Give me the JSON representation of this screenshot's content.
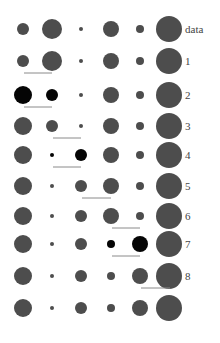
{
  "columns_x": [
    23,
    52,
    81,
    111,
    140,
    169
  ],
  "label_x": 185,
  "colors": {
    "gray": "#4d4d4d",
    "black": "#050505",
    "line": "#8a8a8a"
  },
  "rows": [
    {
      "label": "data",
      "y": 29,
      "radii": [
        6,
        10,
        2,
        8,
        4,
        13
      ],
      "black": [],
      "underline": null
    },
    {
      "label": "1",
      "y": 61,
      "radii": [
        6,
        10,
        2,
        8,
        4,
        13
      ],
      "black": [],
      "underline": [
        24,
        52
      ]
    },
    {
      "label": "2",
      "y": 95,
      "radii": [
        9,
        6,
        2,
        8,
        4,
        13
      ],
      "black": [
        0,
        1
      ],
      "underline": [
        24,
        52
      ]
    },
    {
      "label": "3",
      "y": 126,
      "radii": [
        9,
        6,
        2,
        8,
        4,
        13
      ],
      "black": [],
      "underline": [
        53,
        81
      ]
    },
    {
      "label": "4",
      "y": 155,
      "radii": [
        9,
        2,
        6,
        8,
        4,
        13
      ],
      "black": [
        1,
        2
      ],
      "underline": [
        53,
        81
      ]
    },
    {
      "label": "5",
      "y": 186,
      "radii": [
        9,
        2,
        6,
        8,
        4,
        13
      ],
      "black": [],
      "underline": [
        82,
        111
      ]
    },
    {
      "label": "6",
      "y": 216,
      "radii": [
        9,
        2,
        6,
        8,
        4,
        13
      ],
      "black": [],
      "underline": [
        112,
        140
      ]
    },
    {
      "label": "7",
      "y": 244,
      "radii": [
        9,
        2,
        6,
        4,
        8,
        13
      ],
      "black": [
        3,
        4
      ],
      "underline": [
        112,
        140
      ]
    },
    {
      "label": "8",
      "y": 276,
      "radii": [
        9,
        2,
        6,
        4,
        8,
        13
      ],
      "black": [],
      "underline": [
        141,
        170
      ]
    },
    {
      "label": "",
      "y": 308,
      "radii": [
        9,
        2,
        6,
        4,
        8,
        13
      ],
      "black": [],
      "underline": null
    }
  ]
}
